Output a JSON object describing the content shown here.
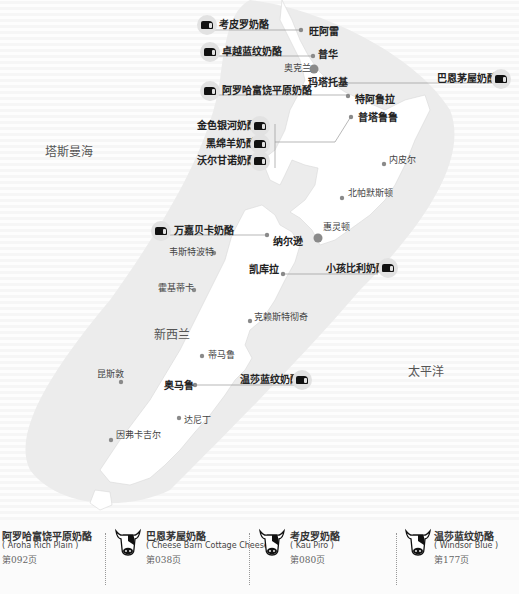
{
  "map": {
    "oceans": {
      "tasman": "塔斯曼海",
      "pacific": "太平洋",
      "country": "新西兰"
    },
    "cities": [
      {
        "name": "旺阿雷",
        "bold": true
      },
      {
        "name": "普华",
        "bold": true
      },
      {
        "name": "奥克兰",
        "bold": false
      },
      {
        "name": "玛塔托基",
        "bold": true
      },
      {
        "name": "特阿鲁拉",
        "bold": true
      },
      {
        "name": "普塔鲁鲁",
        "bold": true
      },
      {
        "name": "内皮尔",
        "bold": false
      },
      {
        "name": "北帕默斯顿",
        "bold": false
      },
      {
        "name": "惠灵顿",
        "bold": false
      },
      {
        "name": "纳尔逊",
        "bold": true
      },
      {
        "name": "韦斯特波特",
        "bold": false
      },
      {
        "name": "凯库拉",
        "bold": true
      },
      {
        "name": "霍基蒂卡",
        "bold": false
      },
      {
        "name": "克赖斯特彻奇",
        "bold": false
      },
      {
        "name": "蒂马鲁",
        "bold": false
      },
      {
        "name": "昆斯敦",
        "bold": false
      },
      {
        "name": "奥马鲁",
        "bold": true
      },
      {
        "name": "达尼丁",
        "bold": false
      },
      {
        "name": "因弗卡吉尔",
        "bold": false
      }
    ],
    "cheeses": [
      {
        "name": "考皮罗奶酪"
      },
      {
        "name": "卓越蓝纹奶酪"
      },
      {
        "name": "巴恩茅屋奶酪"
      },
      {
        "name": "阿罗哈富饶平原奶酪"
      },
      {
        "name": "金色银河奶酪"
      },
      {
        "name": "黑绵羊奶酪"
      },
      {
        "name": "沃尔甘诺奶酪"
      },
      {
        "name": "万嘉贝卡奶酪"
      },
      {
        "name": "小孩比利奶酪"
      },
      {
        "name": "温莎蓝纹奶酪"
      }
    ]
  },
  "legend": [
    {
      "name": "阿罗哈富饶平原奶酪",
      "english": "( Aroha Rich Plain )",
      "page": "第092页",
      "icon": "cow-icon"
    },
    {
      "name": "巴恩茅屋奶酪",
      "english": "( Cheese Barn Cottage Cheese )",
      "page": "第038页",
      "icon": "cow-icon"
    },
    {
      "name": "考皮罗奶酪",
      "english": "( Kau Piro )",
      "page": "第080页",
      "icon": "cow-icon"
    },
    {
      "name": "温莎蓝纹奶酪",
      "english": "( Windsor Blue )",
      "page": "第177页",
      "icon": "cow-icon"
    }
  ],
  "colors": {
    "land": "#ffffff",
    "band": "#ececec",
    "dot": "#8a8a8a",
    "leader": "#9a9a9a",
    "text": "#222222"
  }
}
